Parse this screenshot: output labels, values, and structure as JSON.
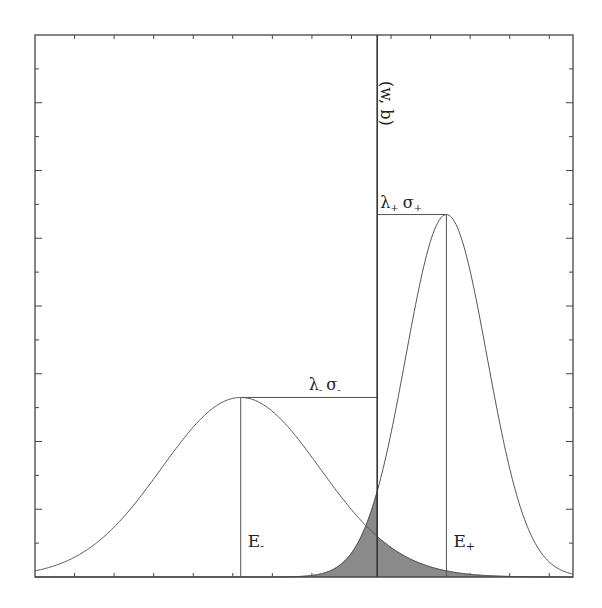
{
  "diagram": {
    "separator_label": "(w, b)",
    "left_class": {
      "mean_label": "E-",
      "mean_label_main": "E",
      "mean_label_sub": "-",
      "spread_label_lambda": "λ",
      "spread_label_lambda_sub": "-",
      "spread_label_sigma": "σ",
      "spread_label_sigma_sub": "-",
      "mean": 5.2,
      "sigma": 2.0,
      "peak": 0.53
    },
    "right_class": {
      "mean_label": "E+",
      "mean_label_main": "E",
      "mean_label_sub": "+",
      "spread_label_lambda": "λ",
      "spread_label_lambda_sub": "+",
      "spread_label_sigma": "σ",
      "spread_label_sigma_sub": "+",
      "mean": 10.4,
      "sigma": 1.03,
      "peak": 1.07
    },
    "separator_position": 8.65,
    "x_range": [
      0,
      13.6
    ],
    "y_range": [
      0,
      1.6
    ],
    "colors": {
      "line": "#555555",
      "frame": "#444444",
      "shade": "#8a8a8a",
      "shade_stroke": "#666666"
    }
  }
}
